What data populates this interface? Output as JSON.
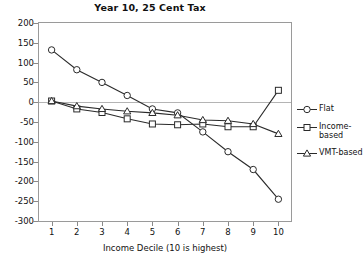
{
  "chart_data": {
    "type": "line",
    "title": "Year 10, 25 Cent Tax",
    "xlabel": "Income Decile (10 is highest)",
    "ylabel": "",
    "categories": [
      "1",
      "2",
      "3",
      "4",
      "5",
      "6",
      "7",
      "8",
      "9",
      "10"
    ],
    "x": [
      1,
      2,
      3,
      4,
      5,
      6,
      7,
      8,
      9,
      10
    ],
    "xlim": [
      0.5,
      10.5
    ],
    "ylim": [
      -300,
      200
    ],
    "yticks": [
      200,
      150,
      100,
      50,
      0,
      -50,
      -100,
      -150,
      -200,
      -250,
      -300
    ],
    "ytick_labels": [
      "200",
      "150",
      "100",
      "50",
      "0",
      "-50",
      "-100",
      "-150",
      "-200",
      "-250",
      "-300"
    ],
    "grid": false,
    "zero_line": true,
    "legend_position": "right",
    "series": [
      {
        "name": "Flat",
        "marker": "circle",
        "color": "#2a2a2a",
        "values": [
          132,
          82,
          50,
          17,
          -17,
          -27,
          -75,
          -125,
          -170,
          -245
        ]
      },
      {
        "name": "Income-based",
        "marker": "square",
        "color": "#2a2a2a",
        "values": [
          3,
          -17,
          -26,
          -42,
          -55,
          -57,
          -55,
          -62,
          -62,
          30
        ]
      },
      {
        "name": "VMT-based",
        "marker": "triangle",
        "color": "#2a2a2a",
        "values": [
          3,
          -10,
          -17,
          -23,
          -27,
          -33,
          -45,
          -47,
          -55,
          -80
        ]
      }
    ]
  },
  "legend": {
    "items": [
      {
        "label": "Flat"
      },
      {
        "label": "Income-based"
      },
      {
        "label": "VMT-based"
      }
    ]
  }
}
